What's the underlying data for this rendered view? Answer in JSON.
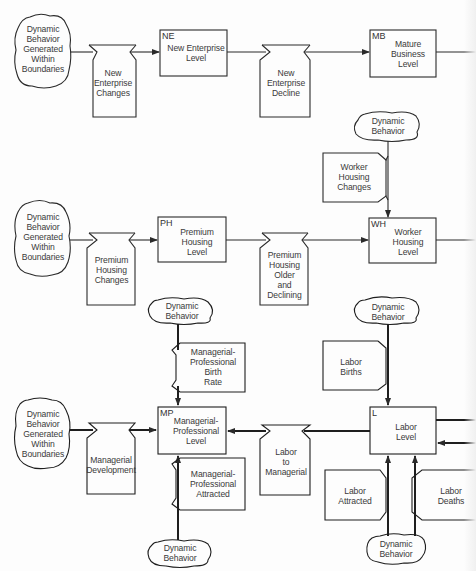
{
  "diagram": {
    "type": "system-dynamics-flow-diagram",
    "clouds": {
      "c1": "Dynamic\nBehavior\nGenerated\nWithin\nBoundaries",
      "c2": "Dynamic\nBehavior",
      "c3": "Dynamic\nBehavior\nGenerated\nWithin\nBoundaries",
      "c4": "Dynamic\nBehavior",
      "c5": "Dynamic\nBehavior",
      "c6": "Dynamic\nBehavior\nGenerated\nWithin\nBoundaries",
      "c7": "Dynamic\nBehavior",
      "c8": "Dynamic\nBehavior"
    },
    "levels": {
      "ne": {
        "code": "NE",
        "label": "New Enterprise\nLevel"
      },
      "mb": {
        "code": "MB",
        "label": "Mature\nBusiness\nLevel"
      },
      "ph": {
        "code": "PH",
        "label": "Premium\nHousing\nLevel"
      },
      "wh": {
        "code": "WH",
        "label": "Worker\nHousing\nLevel"
      },
      "mp": {
        "code": "MP",
        "label": "Managerial-\nProfessional\nLevel"
      },
      "l": {
        "code": "L",
        "label": "Labor\nLevel"
      }
    },
    "rates": {
      "nec": "New\nEnterprise\nChanges",
      "ned": "New\nEnterprise\nDecline",
      "whc": "Worker\nHousing\nChanges",
      "phc": "Premium\nHousing\nChanges",
      "phod": "Premium\nHousing\nOlder\nand\nDeclining",
      "mpbr": "Managerial-\nProfessional\nBirth\nRate",
      "lb": "Labor\nBirths",
      "md": "Managerial\nDevelopment",
      "ltm": "Labor\nto\nManagerial",
      "mpa": "Managerial-\nProfessional\nAttracted",
      "la": "Labor\nAttracted",
      "ld": "Labor\nDeaths"
    },
    "colors": {
      "line": "#2a2a2a",
      "text": "#3a3a3a",
      "background": "#fdfdfd"
    }
  }
}
